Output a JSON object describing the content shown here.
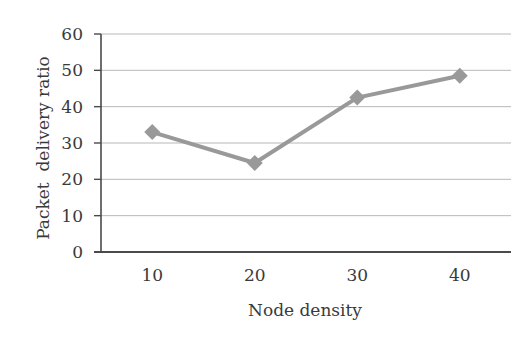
{
  "chart_data": {
    "type": "line",
    "title": "",
    "xlabel": "Node density",
    "ylabel": "Packet  delivery ratio",
    "categories": [
      "10",
      "20",
      "30",
      "40"
    ],
    "x": [
      10,
      20,
      30,
      40
    ],
    "series": [
      {
        "name": "Packet delivery ratio",
        "values": [
          33,
          24.5,
          42.5,
          48.5
        ],
        "color": "#999999",
        "marker": "diamond"
      }
    ],
    "ylim": [
      0,
      60
    ],
    "yticks": [
      0,
      10,
      20,
      30,
      40,
      50,
      60
    ],
    "grid": true,
    "legend": null
  },
  "colors": {
    "line": "#999999",
    "grid": "#b8b8b8",
    "axis": "#4a4a4a",
    "text": "#3a3a3a"
  }
}
